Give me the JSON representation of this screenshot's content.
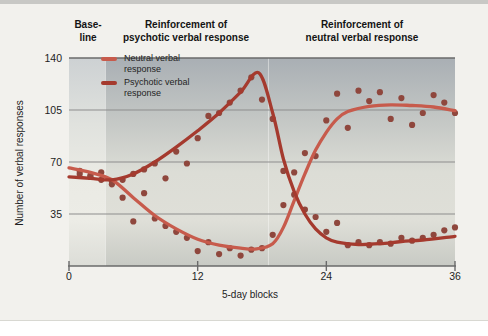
{
  "chart_data": {
    "type": "scatter",
    "title": "",
    "xlabel": "5-day blocks",
    "ylabel": "Number of verbal responses",
    "x_ticks": [
      0,
      12,
      24,
      36
    ],
    "y_ticks": [
      35,
      70,
      105,
      140
    ],
    "xlim": [
      0,
      36
    ],
    "ylim": [
      0,
      140
    ],
    "grid": "horizontal",
    "legend_position": "top-left-inside",
    "dot_color": "#8f473d",
    "axis_color": "#6a6a6a",
    "phases": [
      {
        "label_line1": "Base-",
        "label_line2": "line",
        "x_start": 0,
        "x_end": 3.4
      },
      {
        "label_line1": "Reinforcement of",
        "label_line2": "psychotic verbal response",
        "x_start": 3.4,
        "x_end": 18.6
      },
      {
        "label_line1": "Reinforcement of",
        "label_line2": "neutral verbal response",
        "x_start": 18.6,
        "x_end": 36
      }
    ],
    "series": [
      {
        "name": "Neutral verbal response",
        "color": "#c75b4c",
        "x": [
          1,
          2,
          3,
          4,
          5,
          6,
          7,
          8,
          9,
          10,
          11,
          12,
          13,
          14,
          15,
          16,
          17,
          18,
          19,
          20,
          21,
          22,
          23,
          24,
          25,
          26,
          27,
          28,
          29,
          30,
          31,
          32,
          33,
          34,
          35,
          36
        ],
        "y": [
          64,
          61,
          58,
          55,
          46,
          30,
          49,
          32,
          27,
          23,
          19,
          10,
          16,
          8,
          12,
          7,
          11,
          12,
          21,
          41,
          63,
          76,
          74,
          98,
          116,
          93,
          118,
          111,
          117,
          99,
          113,
          95,
          103,
          115,
          110,
          103
        ],
        "trend": [
          [
            0,
            66
          ],
          [
            2,
            63
          ],
          [
            4,
            58
          ],
          [
            6,
            46
          ],
          [
            8,
            34
          ],
          [
            10,
            25
          ],
          [
            12,
            18
          ],
          [
            14,
            14
          ],
          [
            16,
            12
          ],
          [
            17.5,
            11.5
          ],
          [
            19,
            15
          ],
          [
            20,
            26
          ],
          [
            21,
            44
          ],
          [
            22,
            62
          ],
          [
            23,
            78
          ],
          [
            24,
            90
          ],
          [
            25,
            99
          ],
          [
            26,
            104
          ],
          [
            28,
            107.5
          ],
          [
            30,
            108.5
          ],
          [
            32,
            108
          ],
          [
            34,
            107
          ],
          [
            36,
            104.5
          ]
        ]
      },
      {
        "name": "Psychotic verbal response",
        "color": "#a53a2e",
        "x": [
          1,
          2,
          3,
          4,
          5,
          6,
          7,
          8,
          9,
          10,
          11,
          12,
          13,
          14,
          15,
          16,
          17,
          18,
          19,
          20,
          21,
          22,
          23,
          24,
          25,
          26,
          27,
          28,
          29,
          30,
          31,
          32,
          33,
          34,
          35,
          36
        ],
        "y": [
          62,
          60,
          63,
          57,
          58,
          62,
          65,
          69,
          59,
          77,
          69,
          86,
          101,
          103,
          110,
          118,
          127,
          112,
          99,
          64,
          48,
          38,
          33,
          23,
          29,
          14,
          16,
          14,
          16,
          15,
          19,
          17,
          19,
          21,
          24,
          26
        ],
        "trend": [
          [
            0,
            60
          ],
          [
            2,
            59
          ],
          [
            4,
            58
          ],
          [
            6,
            62
          ],
          [
            8,
            70
          ],
          [
            10,
            80
          ],
          [
            12,
            91
          ],
          [
            14,
            103
          ],
          [
            16,
            117
          ],
          [
            17.7,
            130
          ],
          [
            19,
            103
          ],
          [
            20,
            72
          ],
          [
            21,
            50
          ],
          [
            22,
            35
          ],
          [
            23,
            25
          ],
          [
            24,
            19
          ],
          [
            25,
            16
          ],
          [
            27,
            14.5
          ],
          [
            29,
            15
          ],
          [
            31,
            16.5
          ],
          [
            33,
            17.5
          ],
          [
            36,
            20
          ]
        ]
      }
    ]
  }
}
